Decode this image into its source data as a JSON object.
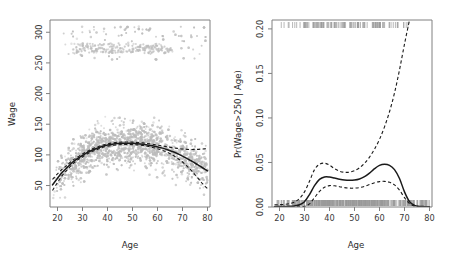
{
  "figure": {
    "name": "wage-vs-age-degree4-polynomial",
    "background_color": "#ffffff",
    "point_color": "#bcbcbc",
    "curve_color": "#1a1a1a",
    "axis_color": "#808080",
    "rug_color": "#9a9a9a"
  },
  "chart_data": [
    {
      "type": "scatter",
      "name": "Degree-4 Polynomial",
      "title": "",
      "xlabel": "Age",
      "ylabel": "Wage",
      "xlim": [
        17,
        81
      ],
      "ylim": [
        15,
        320
      ],
      "grid": false,
      "legend": "none",
      "xticks": [
        20,
        30,
        40,
        50,
        60,
        70,
        80
      ],
      "xtick_labels": [
        "20",
        "30",
        "40",
        "50",
        "60",
        "70",
        "80"
      ],
      "yticks": [
        50,
        100,
        150,
        200,
        250,
        300
      ],
      "ytick_labels": [
        "50",
        "100",
        "150",
        "200",
        "250",
        "300"
      ],
      "annotations": [
        "Dense cloud of grey points: individual workers",
        "Upper band of points near wage 270-280: top-coded high earners",
        "Solid black line: degree-4 polynomial least squares fit",
        "Dashed black lines: pointwise twice-standard-error confidence band"
      ],
      "series": [
        {
          "name": "fit",
          "style": "solid",
          "x": [
            18,
            20,
            22,
            24,
            26,
            28,
            30,
            32,
            34,
            36,
            38,
            40,
            42,
            44,
            46,
            48,
            50,
            52,
            54,
            56,
            58,
            60,
            62,
            64,
            66,
            68,
            70,
            72,
            74,
            76,
            78,
            80
          ],
          "y": [
            51,
            62,
            72,
            80,
            88,
            94,
            99,
            104,
            108,
            111,
            114,
            116,
            117.5,
            118.5,
            119,
            119,
            118.8,
            118.3,
            117.5,
            116.3,
            114.8,
            113,
            111,
            108.5,
            105.5,
            102,
            98,
            93.5,
            89,
            84,
            79,
            74
          ]
        },
        {
          "name": "upper-confidence-band",
          "style": "dashed",
          "x": [
            18,
            20,
            22,
            24,
            26,
            28,
            30,
            32,
            34,
            36,
            38,
            40,
            42,
            44,
            46,
            48,
            50,
            52,
            54,
            56,
            58,
            60,
            62,
            64,
            66,
            68,
            70,
            72,
            74,
            76,
            78,
            80
          ],
          "y": [
            60,
            69,
            77,
            84,
            91,
            96.5,
            101.5,
            106,
            110,
            113,
            116,
            118,
            119.5,
            120.5,
            121,
            121,
            120.8,
            120.3,
            119.6,
            118.6,
            117.4,
            116,
            114.6,
            113.2,
            111.8,
            110.6,
            109.6,
            109,
            108.8,
            109,
            109.6,
            110
          ]
        },
        {
          "name": "lower-confidence-band",
          "style": "dashed",
          "x": [
            18,
            20,
            22,
            24,
            26,
            28,
            30,
            32,
            34,
            36,
            38,
            40,
            42,
            44,
            46,
            48,
            50,
            52,
            54,
            56,
            58,
            60,
            62,
            64,
            66,
            68,
            70,
            72,
            74,
            76,
            78,
            80
          ],
          "y": [
            42,
            55,
            67,
            76,
            85,
            91.5,
            96.5,
            102,
            106,
            109,
            112,
            114,
            115.5,
            116.5,
            117,
            117,
            116.8,
            116.3,
            115.4,
            114,
            112.2,
            110,
            107.4,
            104,
            99.8,
            94.6,
            88.4,
            81,
            72.4,
            63,
            53,
            45
          ]
        }
      ]
    },
    {
      "type": "line",
      "name": "logistic-probability-wage-over-250",
      "title": "",
      "xlabel": "Age",
      "ylabel": "Pr(Wage>250 | Age)",
      "xlim": [
        17,
        81
      ],
      "ylim": [
        0.0,
        0.21
      ],
      "grid": false,
      "legend": "none",
      "xticks": [
        20,
        30,
        40,
        50,
        60,
        70,
        80
      ],
      "xtick_labels": [
        "20",
        "30",
        "40",
        "50",
        "60",
        "70",
        "80"
      ],
      "yticks": [
        0.0,
        0.05,
        0.1,
        0.15,
        0.2
      ],
      "ytick_labels": [
        "0.00",
        "0.05",
        "0.10",
        "0.15",
        "0.20"
      ],
      "annotations": [
        "Grey rug at top: ages of workers earning more than 250",
        "Grey rug at bottom: ages of workers earning 250 or less",
        "Solid black line: fitted logistic regression probability",
        "Dashed black lines: pointwise twice-standard-error confidence band",
        "Upper confidence band exits the top of the plot near age 72"
      ],
      "series": [
        {
          "name": "fit",
          "style": "solid",
          "x": [
            18,
            20,
            22,
            24,
            26,
            28,
            30,
            32,
            34,
            36,
            38,
            40,
            42,
            44,
            46,
            48,
            50,
            52,
            54,
            56,
            58,
            60,
            62,
            64,
            66,
            68,
            70,
            72,
            74,
            76,
            78,
            80
          ],
          "y": [
            0.0004,
            0.0005,
            0.0006,
            0.0008,
            0.0012,
            0.0025,
            0.006,
            0.014,
            0.024,
            0.031,
            0.0338,
            0.0337,
            0.0325,
            0.0312,
            0.0303,
            0.03,
            0.0303,
            0.0315,
            0.034,
            0.038,
            0.043,
            0.0468,
            0.048,
            0.0468,
            0.042,
            0.032,
            0.017,
            0.006,
            0.0018,
            0.0007,
            0.0004,
            0.0003
          ]
        },
        {
          "name": "upper-confidence-band",
          "style": "dashed",
          "x": [
            18,
            20,
            22,
            24,
            26,
            28,
            30,
            32,
            34,
            36,
            38,
            40,
            42,
            44,
            46,
            48,
            50,
            52,
            54,
            56,
            58,
            60,
            62,
            64,
            66,
            68,
            70,
            72
          ],
          "y": [
            0.0024,
            0.0026,
            0.003,
            0.0038,
            0.0056,
            0.0095,
            0.017,
            0.029,
            0.042,
            0.048,
            0.0492,
            0.047,
            0.043,
            0.0402,
            0.039,
            0.0392,
            0.0408,
            0.044,
            0.049,
            0.056,
            0.065,
            0.076,
            0.09,
            0.107,
            0.128,
            0.154,
            0.183,
            0.21
          ]
        },
        {
          "name": "lower-confidence-band",
          "style": "dashed",
          "x": [
            18,
            20,
            22,
            24,
            26,
            28,
            30,
            32,
            34,
            36,
            38,
            40,
            42,
            44,
            46,
            48,
            50,
            52,
            54,
            56,
            58,
            60,
            62,
            64,
            66,
            68,
            70,
            72,
            74,
            76,
            78,
            80
          ],
          "y": [
            0.0,
            0.0,
            0.0,
            0.0,
            0.0001,
            0.0002,
            0.0008,
            0.0035,
            0.0105,
            0.0175,
            0.0222,
            0.024,
            0.0238,
            0.0228,
            0.0218,
            0.0212,
            0.0212,
            0.0218,
            0.0232,
            0.0252,
            0.0272,
            0.0285,
            0.0288,
            0.0278,
            0.0248,
            0.019,
            0.0105,
            0.0038,
            0.001,
            0.0003,
            0.0001,
            0.0
          ]
        }
      ]
    }
  ],
  "panels": {
    "left": {
      "xlabel": "Age",
      "ylabel": "Wage",
      "xticks": [
        "20",
        "30",
        "40",
        "50",
        "60",
        "70",
        "80"
      ],
      "yticks": [
        "50",
        "100",
        "150",
        "200",
        "250",
        "300"
      ]
    },
    "right": {
      "xlabel": "Age",
      "ylabel": "Pr(Wage>250 | Age)",
      "xticks": [
        "20",
        "30",
        "40",
        "50",
        "60",
        "70",
        "80"
      ],
      "yticks": [
        "0.00",
        "0.05",
        "0.10",
        "0.15",
        "0.20"
      ]
    }
  }
}
